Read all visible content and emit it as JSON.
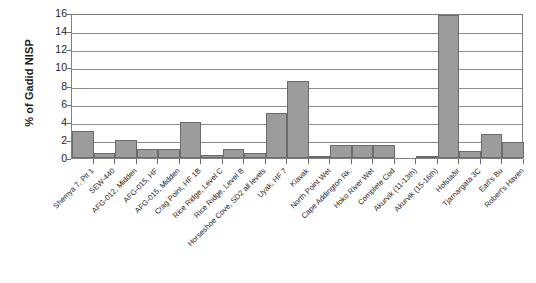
{
  "chart_data": {
    "type": "bar",
    "title": "",
    "subtitle": "",
    "xlabel": "",
    "ylabel": "% of Gadid NISP",
    "ylim": [
      0,
      16
    ],
    "ytick_labels": [
      "16",
      "14",
      "12",
      "10",
      "8",
      "6",
      "4",
      "2",
      "0"
    ],
    "ytick_values": [
      16,
      14,
      12,
      10,
      8,
      6,
      4,
      2,
      0
    ],
    "grid": true,
    "legend": false,
    "legend_position": "none",
    "bar_color": "#9c9c9c",
    "bar_border_color": "#6b6b6b",
    "axis_color": "#808080",
    "gridline_color": "#8c8c8c",
    "categories": [
      "Shemya 7, Pit 1",
      "SEW-440",
      "AFG-012, Midden",
      "AFG-015, HF",
      "AFG-015, Midden",
      "Crag Point, HF 1B",
      "Rice Ridge, Level C",
      "Rice Ridge, Level B",
      "Horseshoe Cove, SD2 all levels",
      "Uyak, HF 7",
      "Kiavak",
      "North Point Wet",
      "Cape Addington Rk.",
      "Hoko River Wet",
      "Complete Cod",
      "Akurvik (11-13th)",
      "Akurvik (15-16th)",
      "Hofstaðir",
      "Tjarnargata 3C",
      "Earl's Bu",
      "Robert's Haven"
    ],
    "values": [
      3.0,
      0.6,
      2.0,
      1.0,
      1.0,
      4.0,
      0.3,
      1.0,
      0.6,
      5.0,
      8.5,
      0.2,
      1.4,
      1.4,
      1.4,
      0.0,
      0.25,
      15.8,
      0.75,
      2.6,
      1.8
    ],
    "series": [
      {
        "name": "% of Gadid NISP",
        "values": [
          3.0,
          0.6,
          2.0,
          1.0,
          1.0,
          4.0,
          0.3,
          1.0,
          0.6,
          5.0,
          8.5,
          0.2,
          1.4,
          1.4,
          1.4,
          0.0,
          0.25,
          15.8,
          0.75,
          2.6,
          1.8
        ]
      }
    ]
  }
}
